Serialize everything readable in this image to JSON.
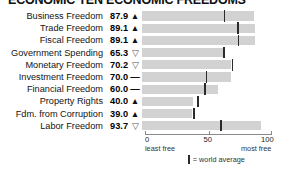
{
  "title": "ECONOMIC TEN ECONOMIC FREEDOMS",
  "legend": {
    "swatch_icon": "vertical-bar-icon",
    "text": "= world average"
  },
  "axis": {
    "ticks": [
      "0",
      "50",
      "100"
    ],
    "tick_values": [
      0,
      50,
      100
    ],
    "left_sublabel": "least free",
    "right_sublabel": "most free"
  },
  "trend_glyphs": {
    "up": "▲",
    "down": "▽",
    "flat": "—"
  },
  "colors": {
    "bar": "#d2d2d2",
    "marker": "#2b2b2b",
    "axis": "#8a8a8a",
    "text": "#141414"
  },
  "chart_data": {
    "type": "bar",
    "title": "ECONOMIC TEN ECONOMIC FREEDOMS",
    "xlabel": "",
    "ylabel": "",
    "xlim": [
      0,
      100
    ],
    "grid": false,
    "legend_position": "bottom",
    "categories": [
      "Business Freedom",
      "Trade Freedom",
      "Fiscal Freedom",
      "Government Spending",
      "Monetary Freedom",
      "Investment Freedom",
      "Financial Freedom",
      "Property Rights",
      "Fdm. from Corruption",
      "Labor Freedom"
    ],
    "values": [
      87.9,
      89.1,
      89.1,
      65.3,
      70.2,
      70.0,
      60.0,
      40.0,
      39.0,
      93.7
    ],
    "trends": [
      "up",
      "up",
      "up",
      "down",
      "down",
      "flat",
      "flat",
      "up",
      "up",
      "down"
    ],
    "world_average": [
      64.3,
      74.8,
      75.4,
      63.9,
      70.6,
      50.2,
      49.0,
      43.6,
      40.5,
      61.5
    ],
    "rows": [
      {
        "label": "Business Freedom",
        "value": "87.9",
        "value_num": 87.9,
        "trend": "up",
        "world_average": 64.3
      },
      {
        "label": "Trade Freedom",
        "value": "89.1",
        "value_num": 89.1,
        "trend": "up",
        "world_average": 74.8
      },
      {
        "label": "Fiscal Freedom",
        "value": "89.1",
        "value_num": 89.1,
        "trend": "up",
        "world_average": 75.4
      },
      {
        "label": "Government Spending",
        "value": "65.3",
        "value_num": 65.3,
        "trend": "down",
        "world_average": 63.9
      },
      {
        "label": "Monetary Freedom",
        "value": "70.2",
        "value_num": 70.2,
        "trend": "down",
        "world_average": 70.6
      },
      {
        "label": "Investment Freedom",
        "value": "70.0",
        "value_num": 70.0,
        "trend": "flat",
        "world_average": 50.2
      },
      {
        "label": "Financial Freedom",
        "value": "60.0",
        "value_num": 60.0,
        "trend": "flat",
        "world_average": 49.0
      },
      {
        "label": "Property Rights",
        "value": "40.0",
        "value_num": 40.0,
        "trend": "up",
        "world_average": 43.6
      },
      {
        "label": "Fdm. from Corruption",
        "value": "39.0",
        "value_num": 39.0,
        "trend": "up",
        "world_average": 40.5
      },
      {
        "label": "Labor Freedom",
        "value": "93.7",
        "value_num": 93.7,
        "trend": "down",
        "world_average": 61.5
      }
    ]
  }
}
